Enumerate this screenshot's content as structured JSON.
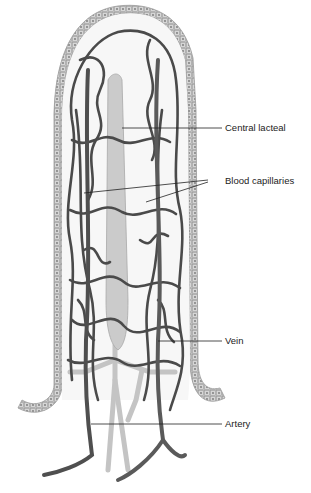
{
  "labels": {
    "central_lacteal": "Central lacteal",
    "blood_capillaries": "Blood capillaries",
    "vein": "Vein",
    "artery": "Artery"
  },
  "colors": {
    "vessel": "#4a4a4a",
    "epithelium": "#b8b8b8",
    "epithelium_cell": "#d4d4d4",
    "lacteal": "#c8c8c8",
    "leader": "#222222",
    "background": "#ffffff"
  }
}
